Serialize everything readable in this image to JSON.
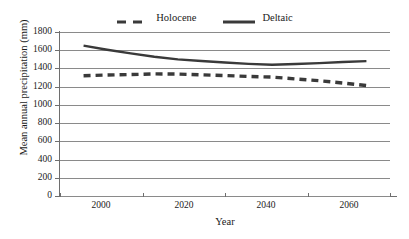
{
  "chart_data": {
    "type": "line",
    "title": "",
    "xlabel": "Year",
    "ylabel": "Mean annual precipitation (mm)",
    "xlim": [
      1995,
      2065
    ],
    "ylim": [
      0,
      1800
    ],
    "ytick_step": 200,
    "yticks": [
      1800,
      1600,
      1400,
      1200,
      1000,
      800,
      600,
      400,
      200,
      0
    ],
    "xticks": [
      2000,
      2020,
      2040,
      2060
    ],
    "grid": "horizontal",
    "legend_position": "top-center",
    "x": [
      2000,
      2005,
      2010,
      2015,
      2020,
      2025,
      2030,
      2035,
      2040,
      2045,
      2050,
      2055,
      2060
    ],
    "series": [
      {
        "name": "Holocene",
        "style": "dashed",
        "color": "#3a3a3a",
        "values": [
          1320,
          1328,
          1333,
          1340,
          1338,
          1330,
          1322,
          1312,
          1305,
          1285,
          1265,
          1240,
          1212
        ]
      },
      {
        "name": "Deltaic",
        "style": "solid",
        "color": "#3a3a3a",
        "values": [
          1650,
          1605,
          1565,
          1528,
          1500,
          1482,
          1465,
          1450,
          1440,
          1448,
          1458,
          1470,
          1480
        ]
      }
    ]
  },
  "legend": {
    "entries": [
      {
        "label": "Holocene",
        "style": "dashed"
      },
      {
        "label": "Deltaic",
        "style": "solid"
      }
    ]
  },
  "axes": {
    "y_title": "Mean annual precipitation (mm)",
    "x_title": "Year",
    "y_labels": [
      "1800",
      "1600",
      "1400",
      "1200",
      "1000",
      "800",
      "600",
      "400",
      "200",
      "0"
    ],
    "x_labels": [
      "2000",
      "2020",
      "2040",
      "2060"
    ]
  },
  "colors": {
    "line": "#3a3a3a",
    "grid": "#8a8a8a",
    "axis": "#6e6e6e",
    "text": "#1a1a1a",
    "background": "#ffffff"
  }
}
